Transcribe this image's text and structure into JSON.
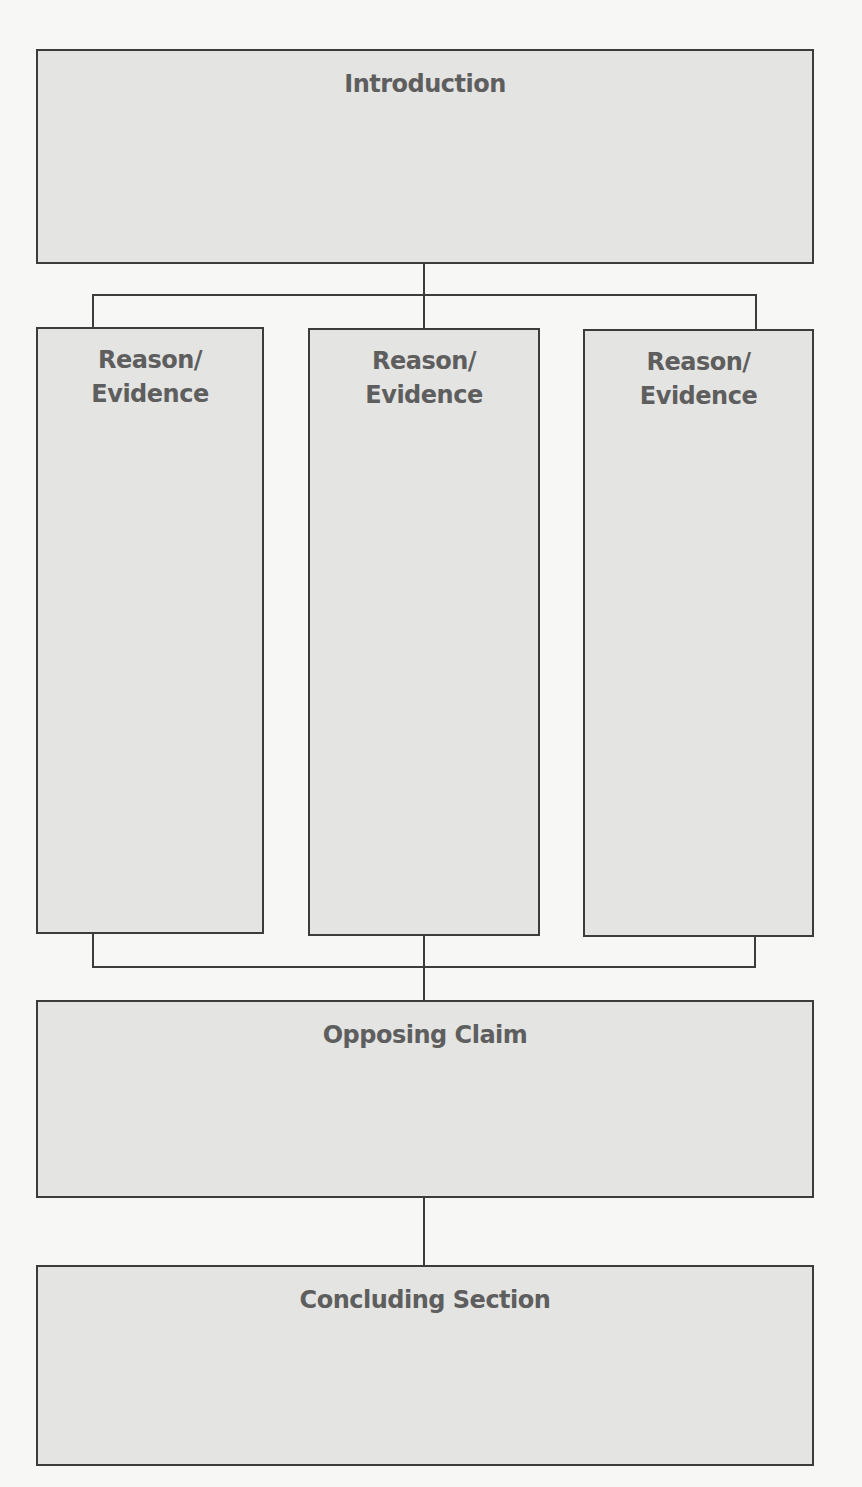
{
  "diagram": {
    "type": "argument-essay-structure",
    "colors": {
      "box_fill": "#e4e4e2",
      "box_border": "#3c3c3c",
      "text": "#5e5e5e",
      "background": "#f7f7f5"
    },
    "introduction": {
      "label": "Introduction"
    },
    "reasons": [
      {
        "label_line1": "Reason/",
        "label_line2": "Evidence"
      },
      {
        "label_line1": "Reason/",
        "label_line2": "Evidence"
      },
      {
        "label_line1": "Reason/",
        "label_line2": "Evidence"
      }
    ],
    "opposing_claim": {
      "label": "Opposing Claim"
    },
    "conclusion": {
      "label": "Concluding Section"
    }
  }
}
